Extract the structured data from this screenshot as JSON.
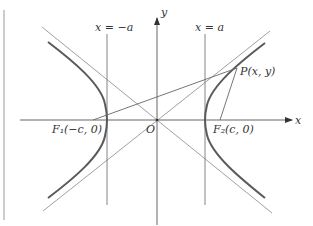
{
  "diagram": {
    "colors": {
      "curve": "#555555",
      "line": "#777777",
      "axis": "#444444",
      "text": "#333333",
      "border": "#999999"
    },
    "labels": {
      "y_axis": "y",
      "x_axis": "x",
      "origin": "O",
      "line_left": "x = −a",
      "line_right": "x = a",
      "point_p": "P(x, y)",
      "focus_1": "F₁(−c, 0)",
      "focus_2": "F₂(c, 0)"
    }
  }
}
